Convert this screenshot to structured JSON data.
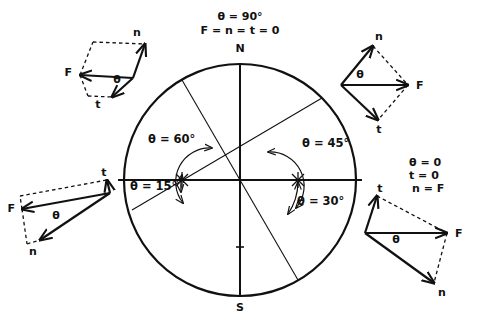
{
  "figure": {
    "title_block": {
      "line1": "θ = 90°",
      "line2": "F = n = t = 0"
    },
    "compass": {
      "north_label": "N",
      "south_label": "S"
    },
    "angle_labels": {
      "upper_left": "θ = 60°",
      "upper_right": "θ = 45°",
      "lower_left": "θ = 15°",
      "lower_right": "θ = 30°"
    },
    "right_text_block": {
      "line1": "θ = 0",
      "line2": "t = 0",
      "line3": "n = F"
    },
    "vector_diagrams": [
      {
        "id": "top-left",
        "force_label": "F",
        "normal_label": "n",
        "tangent_label": "t",
        "angle_label": "θ"
      },
      {
        "id": "top-right",
        "force_label": "F",
        "normal_label": "n",
        "tangent_label": "t",
        "angle_label": "θ"
      },
      {
        "id": "bottom-left",
        "force_label": "F",
        "normal_label": "n",
        "tangent_label": "t",
        "angle_label": "θ"
      },
      {
        "id": "bottom-right",
        "force_label": "F",
        "normal_label": "n",
        "tangent_label": "t",
        "angle_label": "θ"
      }
    ],
    "colors": {
      "ink": "#111111",
      "background": "#ffffff"
    }
  }
}
